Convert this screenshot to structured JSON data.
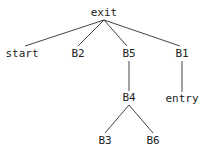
{
  "diagram": {
    "type": "tree",
    "nodes": [
      {
        "id": "exit",
        "label": "exit"
      },
      {
        "id": "start",
        "label": "start"
      },
      {
        "id": "B2",
        "label": "B2"
      },
      {
        "id": "B5",
        "label": "B5"
      },
      {
        "id": "B1",
        "label": "B1"
      },
      {
        "id": "B4",
        "label": "B4"
      },
      {
        "id": "entry",
        "label": "entry"
      },
      {
        "id": "B3",
        "label": "B3"
      },
      {
        "id": "B6",
        "label": "B6"
      }
    ],
    "edges": [
      {
        "from": "exit",
        "to": "start"
      },
      {
        "from": "exit",
        "to": "B2"
      },
      {
        "from": "exit",
        "to": "B5"
      },
      {
        "from": "exit",
        "to": "B1"
      },
      {
        "from": "B5",
        "to": "B4"
      },
      {
        "from": "B1",
        "to": "entry"
      },
      {
        "from": "B4",
        "to": "B3"
      },
      {
        "from": "B4",
        "to": "B6"
      }
    ]
  }
}
